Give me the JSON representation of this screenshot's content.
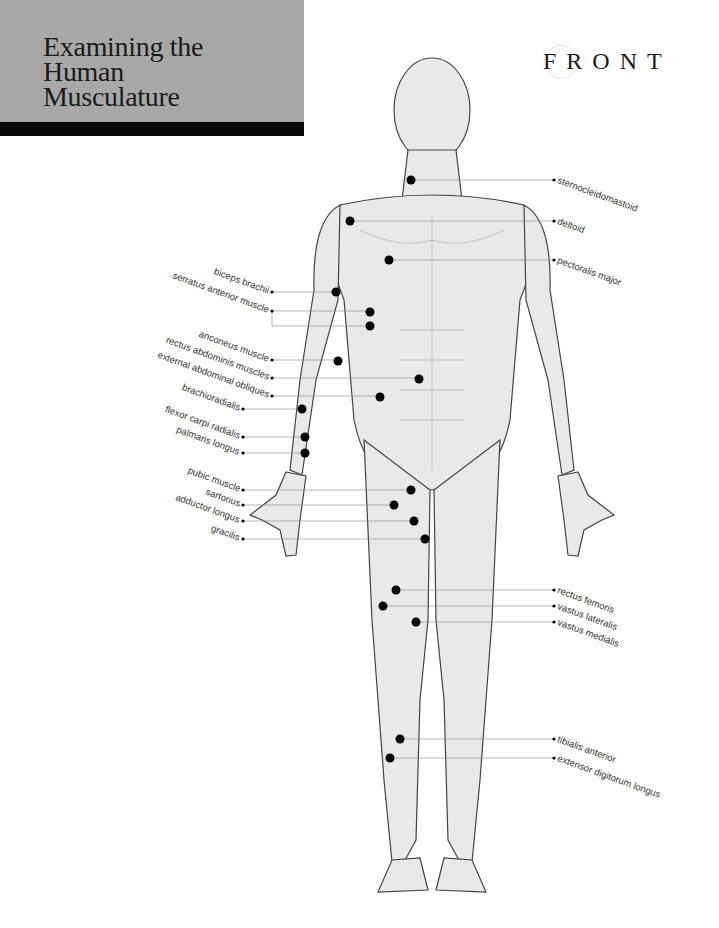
{
  "header": {
    "title_lines": [
      "Examining the",
      "Human",
      "Musculature"
    ],
    "view_label": "FRONT",
    "colors": {
      "block": "#a8a8a8",
      "bar": "#0a0a0a"
    }
  },
  "labels_left": [
    {
      "text": "biceps brachii",
      "y": 292
    },
    {
      "text": "serratus anterior muscle",
      "y": 311
    },
    {
      "text": "anconeus muscle",
      "y": 360
    },
    {
      "text": "rectus abdominis muscles",
      "y": 378
    },
    {
      "text": "external abdominal obliques",
      "y": 396
    },
    {
      "text": "brachioradialis",
      "y": 409
    },
    {
      "text": "flexor carpi radialis",
      "y": 437
    },
    {
      "text": "palmaris longus",
      "y": 453
    },
    {
      "text": "pubic muscle",
      "y": 490
    },
    {
      "text": "sartorius",
      "y": 505
    },
    {
      "text": "adductor longus",
      "y": 521
    },
    {
      "text": "gracilis",
      "y": 539
    }
  ],
  "labels_right": [
    {
      "text": "sternocleidomastoid",
      "y": 180
    },
    {
      "text": "deltoid",
      "y": 221
    },
    {
      "text": "pectoralis major",
      "y": 260
    },
    {
      "text": "rectus femoris",
      "y": 590
    },
    {
      "text": "vastus lateralis",
      "y": 606
    },
    {
      "text": "vastus medialis",
      "y": 622
    },
    {
      "text": "tibialis anterior",
      "y": 739
    },
    {
      "text": "extensor digitorum longus",
      "y": 758
    }
  ]
}
